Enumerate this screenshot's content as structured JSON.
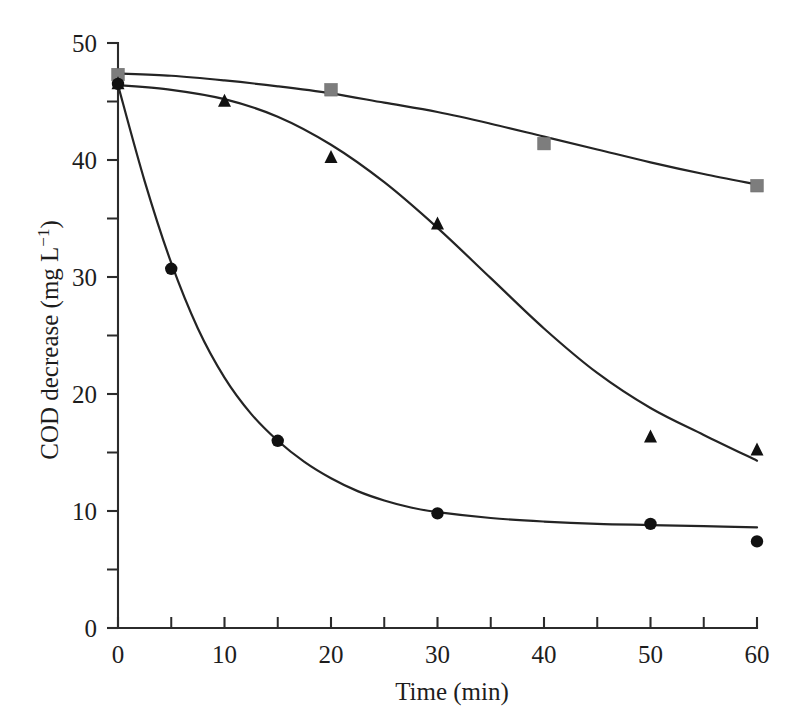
{
  "chart_data": {
    "type": "scatter",
    "title": "",
    "subtitle": "",
    "xlabel": "Time (min)",
    "ylabel": "COD decrease (mg L−1)",
    "ylabel_main": "COD decrease (mg L",
    "ylabel_exponent": "−1",
    "ylabel_close": ")",
    "xlim": [
      0,
      60
    ],
    "ylim": [
      0,
      50
    ],
    "x_major_ticks": [
      0,
      10,
      20,
      30,
      40,
      50,
      60
    ],
    "x_minor_ticks": [
      5,
      15,
      25,
      35,
      45,
      55
    ],
    "y_major_ticks": [
      0,
      10,
      20,
      30,
      40,
      50
    ],
    "y_minor_ticks": [
      5,
      15,
      25,
      35,
      45
    ],
    "x_tick_labels": [
      "0",
      "10",
      "20",
      "30",
      "40",
      "50",
      "60"
    ],
    "y_tick_labels": [
      "0",
      "10",
      "20",
      "30",
      "40",
      "50"
    ],
    "grid": false,
    "legend": false,
    "legend_position": "none",
    "series": [
      {
        "name": "series-squares",
        "marker": "square",
        "color": "#7d7d7d",
        "x": [
          0,
          20,
          40,
          60
        ],
        "values": [
          47.3,
          46.0,
          41.4,
          37.8
        ],
        "fit_curve": [
          [
            0,
            47.4
          ],
          [
            5,
            47.2
          ],
          [
            10,
            46.8
          ],
          [
            15,
            46.3
          ],
          [
            20,
            45.7
          ],
          [
            25,
            44.9
          ],
          [
            30,
            44.1
          ],
          [
            35,
            43.1
          ],
          [
            40,
            42.0
          ],
          [
            45,
            40.9
          ],
          [
            50,
            39.8
          ],
          [
            55,
            38.8
          ],
          [
            60,
            37.9
          ]
        ]
      },
      {
        "name": "series-triangles",
        "marker": "triangle",
        "color": "#111111",
        "x": [
          0,
          10,
          20,
          30,
          50,
          60
        ],
        "values": [
          46.5,
          45.0,
          40.2,
          34.5,
          16.3,
          15.2
        ],
        "fit_curve": [
          [
            0,
            46.4
          ],
          [
            5,
            46.0
          ],
          [
            10,
            45.2
          ],
          [
            15,
            43.7
          ],
          [
            20,
            41.3
          ],
          [
            25,
            38.1
          ],
          [
            30,
            34.2
          ],
          [
            35,
            29.9
          ],
          [
            40,
            25.6
          ],
          [
            45,
            21.8
          ],
          [
            50,
            18.8
          ],
          [
            55,
            16.5
          ],
          [
            60,
            14.3
          ]
        ]
      },
      {
        "name": "series-circles",
        "marker": "circle",
        "color": "#111111",
        "x": [
          0,
          5,
          15,
          30,
          50,
          60
        ],
        "values": [
          46.5,
          30.7,
          16.0,
          9.8,
          8.9,
          7.4
        ],
        "fit_curve": [
          [
            0,
            46.4
          ],
          [
            2.5,
            38.2
          ],
          [
            5,
            31.2
          ],
          [
            7.5,
            25.6
          ],
          [
            10,
            21.4
          ],
          [
            12.5,
            18.3
          ],
          [
            15,
            16.0
          ],
          [
            17.5,
            14.2
          ],
          [
            20,
            12.8
          ],
          [
            22.5,
            11.7
          ],
          [
            25,
            10.9
          ],
          [
            27.5,
            10.3
          ],
          [
            30,
            9.9
          ],
          [
            35,
            9.4
          ],
          [
            40,
            9.1
          ],
          [
            45,
            8.9
          ],
          [
            50,
            8.8
          ],
          [
            55,
            8.7
          ],
          [
            60,
            8.6
          ]
        ]
      }
    ]
  },
  "geometry": {
    "origin_x": 118,
    "origin_y": 628,
    "x_max_px": 757,
    "y_max_px": 43
  }
}
